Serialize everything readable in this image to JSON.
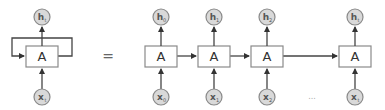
{
  "diagram": {
    "equals_sign": "=",
    "ellipsis": "...",
    "colors": {
      "circle_fill": "#d9d9d9",
      "circle_stroke": "#8a8a8a",
      "box_stroke": "#8a8a8a",
      "edge": "#444444"
    },
    "rolled": {
      "cell_label": "A",
      "output": {
        "base": "h",
        "sub": "t"
      },
      "input": {
        "base": "x",
        "sub": "t"
      }
    },
    "unrolled": [
      {
        "cell_label": "A",
        "output": {
          "base": "h",
          "sub": "0"
        },
        "input": {
          "base": "x",
          "sub": "0"
        }
      },
      {
        "cell_label": "A",
        "output": {
          "base": "h",
          "sub": "1"
        },
        "input": {
          "base": "x",
          "sub": "1"
        }
      },
      {
        "cell_label": "A",
        "output": {
          "base": "h",
          "sub": "2"
        },
        "input": {
          "base": "x",
          "sub": "2"
        }
      },
      {
        "cell_label": "A",
        "output": {
          "base": "h",
          "sub": "t"
        },
        "input": {
          "base": "x",
          "sub": "t"
        }
      }
    ]
  }
}
